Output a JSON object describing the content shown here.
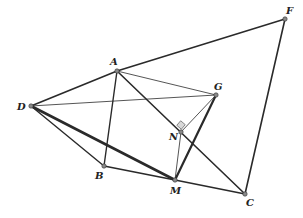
{
  "diagram": {
    "type": "geometry",
    "points": [
      {
        "id": "A",
        "label": "A",
        "x": 117,
        "y": 71,
        "lx": 110,
        "ly": 65
      },
      {
        "id": "D",
        "label": "D",
        "x": 31,
        "y": 106,
        "lx": 17,
        "ly": 110
      },
      {
        "id": "B",
        "label": "B",
        "x": 104,
        "y": 166,
        "lx": 95,
        "ly": 179
      },
      {
        "id": "M",
        "label": "M",
        "x": 175,
        "y": 180,
        "lx": 170,
        "ly": 194
      },
      {
        "id": "C",
        "label": "C",
        "x": 245,
        "y": 194,
        "lx": 246,
        "ly": 206
      },
      {
        "id": "G",
        "label": "G",
        "x": 216,
        "y": 95,
        "lx": 214,
        "ly": 90
      },
      {
        "id": "N",
        "label": "N",
        "x": 181,
        "y": 132,
        "lx": 169,
        "ly": 140
      },
      {
        "id": "F",
        "label": "F",
        "x": 285,
        "y": 19,
        "lx": 286,
        "ly": 14
      }
    ],
    "segments": [
      {
        "from": "D",
        "to": "A",
        "w": 1.6
      },
      {
        "from": "A",
        "to": "F",
        "w": 1.6
      },
      {
        "from": "F",
        "to": "C",
        "w": 1.6
      },
      {
        "from": "A",
        "to": "B",
        "w": 1.4
      },
      {
        "from": "A",
        "to": "C",
        "w": 1.6
      },
      {
        "from": "A",
        "to": "G",
        "w": 0.8
      },
      {
        "from": "D",
        "to": "G",
        "w": 0.8
      },
      {
        "from": "D",
        "to": "B",
        "w": 1.4
      },
      {
        "from": "D",
        "to": "M",
        "w": 2.6
      },
      {
        "from": "B",
        "to": "M",
        "w": 1.6
      },
      {
        "from": "M",
        "to": "C",
        "w": 1.6
      },
      {
        "from": "M",
        "to": "G",
        "w": 2.2
      },
      {
        "from": "N",
        "to": "G",
        "w": 0.8
      },
      {
        "from": "N",
        "to": "M",
        "w": 0.8
      }
    ],
    "right_angle_marker": {
      "at": "N"
    }
  }
}
